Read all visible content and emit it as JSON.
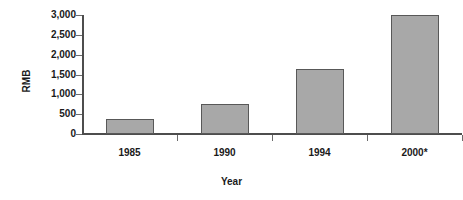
{
  "chart_data": {
    "type": "bar",
    "title": "",
    "subtitle": "",
    "xlabel": "Year",
    "ylabel": "RMB",
    "categories": [
      "1985",
      "1990",
      "1994",
      "2000*"
    ],
    "values": [
      380,
      750,
      1650,
      3000
    ],
    "series": [
      {
        "name": "RMB",
        "values": [
          380,
          750,
          1650,
          3000
        ]
      }
    ],
    "ylim": [
      0,
      3000
    ],
    "yticks": [
      0,
      500,
      1000,
      1500,
      2000,
      2500,
      3000
    ],
    "ytick_labels": [
      "0",
      "500",
      "1,000",
      "1,500",
      "2,000",
      "2,500",
      "3,000"
    ],
    "grid": false,
    "legend": false,
    "legend_position": "none",
    "bar_fill_color": "#a8a8a8",
    "bar_edge_color": "#585858",
    "axis_color": "#4d4d4d",
    "text_color": "#1a1a1a",
    "background_color": "#ffffff",
    "annotations": [
      "* denotes projected value"
    ]
  }
}
